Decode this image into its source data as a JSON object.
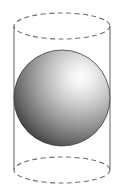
{
  "figure": {
    "title": "Sphere inscribed in a cylinder",
    "caption": "",
    "canvas": {
      "width": 125,
      "height": 188,
      "background": "#ffffff"
    },
    "colors": {
      "background": "#ffffff",
      "outline": "#6e6e6e",
      "dashed_outline": "#6e6e6e",
      "sphere_highlight": "#f2f2f2",
      "sphere_midtone": "#9a9a9a",
      "sphere_shadow": "#4a4a4a",
      "sphere_rim": "#3f3f3f"
    },
    "shapes": [
      {
        "name": "cylinder",
        "type": "cylinder",
        "label": "Cylinder",
        "axis": "vertical",
        "center_x": 62,
        "top_center_y": 26,
        "bottom_center_y": 170,
        "radius_x": 48,
        "radius_y": 13,
        "height": 144,
        "stroke": "#6e6e6e",
        "stroke_width": 1.1,
        "fill": "none",
        "top_ellipse_style": "dashed",
        "bottom_ellipse_style": "dashed",
        "side_line_style": "solid",
        "dash_pattern": "5 3.4"
      },
      {
        "name": "sphere",
        "type": "sphere",
        "label": "Sphere",
        "center_x": 62,
        "center_y": 98,
        "radius": 48,
        "shading": "radial-gradient",
        "highlight_x_pct": 70,
        "highlight_y_pct": 28,
        "highlight_radius_pct": 78,
        "stroke": "#3f3f3f",
        "stroke_width": 0.8
      }
    ],
    "gradient_stops": [
      {
        "offset": "0%",
        "color": "#fdfdfd"
      },
      {
        "offset": "14%",
        "color": "#f0f0f0"
      },
      {
        "offset": "30%",
        "color": "#d8d8d8"
      },
      {
        "offset": "48%",
        "color": "#b8b8b8"
      },
      {
        "offset": "66%",
        "color": "#959595"
      },
      {
        "offset": "82%",
        "color": "#737373"
      },
      {
        "offset": "93%",
        "color": "#5a5a5a"
      },
      {
        "offset": "100%",
        "color": "#474747"
      }
    ],
    "geometry_labels": {
      "sphere_label": "",
      "cylinder_label": "",
      "radius_label": "",
      "height_label": ""
    }
  }
}
